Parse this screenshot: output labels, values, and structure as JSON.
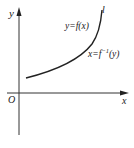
{
  "figure": {
    "axis_x_label": "x",
    "axis_y_label": "y",
    "origin_label": "O",
    "curve_name": "l",
    "curve_label_1": "y=f(x)",
    "curve_label_2_prefix": "x=f",
    "curve_label_2_sup": "−1",
    "curve_label_2_suffix": "(y)",
    "colors": {
      "stroke": "#222222",
      "axis": "#333333",
      "background": "#ffffff"
    }
  }
}
